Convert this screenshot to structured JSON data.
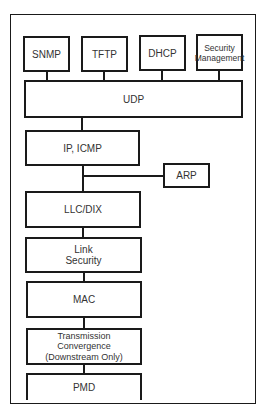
{
  "diagram": {
    "type": "protocol-stack",
    "top_row": [
      {
        "id": "snmp",
        "label": "SNMP"
      },
      {
        "id": "tftp",
        "label": "TFTP"
      },
      {
        "id": "dhcp",
        "label": "DHCP"
      },
      {
        "id": "security-management",
        "label": "Security\nManagement"
      }
    ],
    "layers": [
      {
        "id": "udp",
        "label": "UDP"
      },
      {
        "id": "ip-icmp",
        "label": "IP, ICMP"
      },
      {
        "id": "llc-dix",
        "label": "LLC/DIX"
      },
      {
        "id": "link-security",
        "label": "Link\nSecurity"
      },
      {
        "id": "mac",
        "label": "MAC"
      },
      {
        "id": "transmission-convergence",
        "label": "Transmission\nConvergence\n(Downstream Only)"
      },
      {
        "id": "pmd",
        "label": "PMD"
      }
    ],
    "side": [
      {
        "id": "arp",
        "label": "ARP",
        "attached_between": [
          "ip-icmp",
          "llc-dix"
        ]
      }
    ],
    "connections": [
      [
        "snmp",
        "udp"
      ],
      [
        "tftp",
        "udp"
      ],
      [
        "dhcp",
        "udp"
      ],
      [
        "security-management",
        "udp"
      ],
      [
        "udp",
        "ip-icmp"
      ],
      [
        "ip-icmp",
        "llc-dix"
      ],
      [
        "arp",
        "ip-icmp/llc-dix link"
      ],
      [
        "llc-dix",
        "link-security"
      ],
      [
        "link-security",
        "mac"
      ],
      [
        "mac",
        "transmission-convergence"
      ],
      [
        "transmission-convergence",
        "pmd"
      ]
    ],
    "colors": {
      "line": "#1a1a1a",
      "text": "#333333",
      "background": "#ffffff"
    }
  }
}
